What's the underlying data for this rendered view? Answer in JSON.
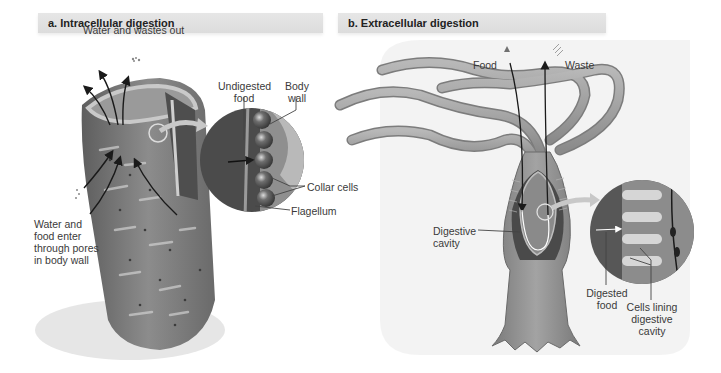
{
  "panels": [
    {
      "id": "a",
      "title": "a. Intracellular digestion",
      "labels": {
        "water_wastes_out": "Water and wastes out",
        "water_food_enter_line1": "Water and",
        "water_food_enter_line2": "food enter",
        "water_food_enter_line3": "through pores",
        "water_food_enter_line4": "in body wall",
        "undigested_food_line1": "Undigested",
        "undigested_food_line2": "food",
        "body_wall_line1": "Body",
        "body_wall_line2": "wall",
        "collar_cells": "Collar cells",
        "flagellum": "Flagellum"
      }
    },
    {
      "id": "b",
      "title": "b. Extracellular digestion",
      "labels": {
        "food": "Food",
        "waste": "Waste",
        "digestive_cavity_line1": "Digestive",
        "digestive_cavity_line2": "cavity",
        "digested_food_line1": "Digested",
        "digested_food_line2": "food",
        "cells_lining_line1": "Cells lining",
        "cells_lining_line2": "digestive",
        "cells_lining_line3": "cavity"
      }
    }
  ],
  "colors": {
    "header_bg": "#dedede",
    "sponge_body": "#7a7a7a",
    "hydra_body": "#8a8a8a",
    "background_halo": "#ececec",
    "zoom_arrow": "#c8c8c8",
    "label_text": "#3a3a3a"
  }
}
